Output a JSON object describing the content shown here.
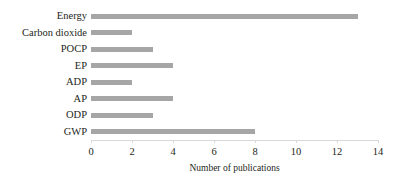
{
  "chart_data": {
    "type": "bar",
    "orientation": "horizontal",
    "title": "",
    "subtitle": "",
    "xlabel": "Number of publications",
    "ylabel": "",
    "categories": [
      "Energy",
      "Carbon dioxide",
      "POCP",
      "EP",
      "ADP",
      "AP",
      "ODP",
      "GWP"
    ],
    "values": [
      13,
      2,
      3,
      4,
      2,
      4,
      3,
      8
    ],
    "xlim": [
      0,
      14
    ],
    "xticks": [
      0,
      2,
      4,
      6,
      8,
      10,
      12,
      14
    ],
    "xtick_labels": [
      "0",
      "2",
      "4",
      "6",
      "8",
      "10",
      "12",
      "14"
    ],
    "grid": false,
    "legend": null,
    "bar_color": "#a6a6a6",
    "background_color": "#ffffff",
    "text_color": "#231f20"
  }
}
